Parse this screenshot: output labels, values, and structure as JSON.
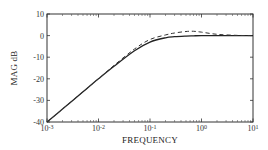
{
  "chart_data": {
    "type": "line",
    "title": "",
    "xlabel": "FREQUENCY",
    "ylabel": "MAG dB",
    "xscale": "log",
    "xlim": [
      0.001,
      10
    ],
    "ylim": [
      -40,
      10
    ],
    "xticks": [
      0.001,
      0.01,
      0.1,
      1,
      10
    ],
    "xtick_labels": [
      {
        "base": "10",
        "exp": "-3"
      },
      {
        "base": "10",
        "exp": "-2"
      },
      {
        "base": "10",
        "exp": "-1"
      },
      {
        "base": "10",
        "exp": "0"
      },
      {
        "base": "10",
        "exp": "1"
      }
    ],
    "yticks": [
      10,
      0,
      -10,
      -20,
      -30,
      -40
    ],
    "ytick_labels": [
      "10",
      "0",
      "-10",
      "-20",
      "-30",
      "-40"
    ],
    "grid": false,
    "legend": null,
    "x": [
      0.001,
      0.002,
      0.005,
      0.01,
      0.02,
      0.05,
      0.1,
      0.2,
      0.3,
      0.5,
      0.7,
      1,
      2,
      5,
      10
    ],
    "series": [
      {
        "name": "solid",
        "style": "solid",
        "color": "#222222",
        "values": [
          -40,
          -34,
          -26,
          -20,
          -14.2,
          -7,
          -3,
          -1,
          -0.5,
          -0.2,
          -0.1,
          0,
          0,
          0,
          0
        ]
      },
      {
        "name": "dashed",
        "style": "dashed",
        "color": "#333333",
        "values": [
          -40,
          -34,
          -26,
          -20,
          -13.8,
          -6.2,
          -1.8,
          0.3,
          1.2,
          1.9,
          2.0,
          1.6,
          0.6,
          0.1,
          0
        ]
      }
    ]
  }
}
